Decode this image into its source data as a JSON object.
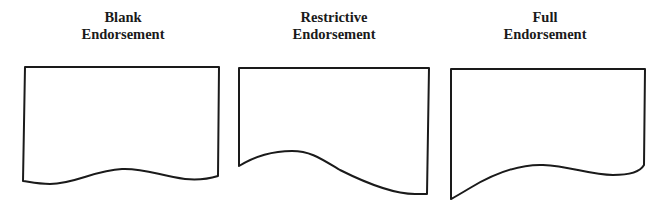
{
  "diagram": {
    "items": [
      {
        "title_line1": "Blank",
        "title_line2": "Endorsement",
        "shape": "document-wave-gentle"
      },
      {
        "title_line1": "Restrictive",
        "title_line2": "Endorsement",
        "shape": "document-wave-deep"
      },
      {
        "title_line1": "Full",
        "title_line2": "Endorsement",
        "shape": "document-wave-rising"
      }
    ],
    "stroke_color": "#1a1a1a",
    "background_color": "#ffffff"
  }
}
